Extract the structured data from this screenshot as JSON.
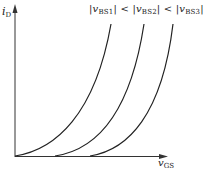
{
  "diagram": {
    "y_axis": {
      "symbol": "i",
      "subscript": "D"
    },
    "x_axis": {
      "symbol": "v",
      "subscript": "GS"
    },
    "legend": {
      "parts": [
        {
          "bar_open": "|",
          "symbol": "v",
          "subscript": "BS1",
          "bar_close": "|"
        },
        {
          "op": "<"
        },
        {
          "bar_open": "|",
          "symbol": "v",
          "subscript": "BS2",
          "bar_close": "|"
        },
        {
          "op": "<"
        },
        {
          "bar_open": "|",
          "symbol": "v",
          "subscript": "BS3",
          "bar_close": "|"
        }
      ],
      "text": "|vBS1| < |vBS2| < |vBS3|"
    },
    "curves": [
      {
        "name": "vBS1",
        "start_x": 15,
        "end_x": 111
      },
      {
        "name": "vBS2",
        "start_x": 55,
        "end_x": 144
      },
      {
        "name": "vBS3",
        "start_x": 90,
        "end_x": 173
      }
    ],
    "colors": {
      "line": "#222222",
      "background": "#ffffff"
    }
  }
}
